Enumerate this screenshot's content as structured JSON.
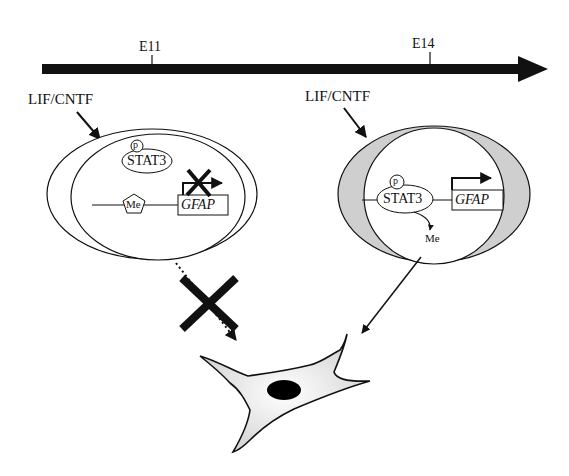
{
  "timeline": {
    "markers": [
      {
        "label": "E11",
        "x": 152
      },
      {
        "label": "E14",
        "x": 430
      }
    ]
  },
  "stimulus_label": "LIF/CNTF",
  "left_cell": {
    "stimulus": "LIF/CNTF",
    "phospho": "p",
    "factor": "STAT3",
    "methyl": "Me",
    "gene": "GFAP",
    "transcription": "blocked"
  },
  "right_cell": {
    "stimulus": "LIF/CNTF",
    "phospho": "p",
    "factor": "STAT3",
    "methyl": "Me",
    "gene": "GFAP",
    "transcription": "active"
  },
  "outcome": {
    "left_path": "blocked",
    "right_path": "astrocyte"
  },
  "colors": {
    "ink": "#111111",
    "shade": "#c8c8c8",
    "nucleus": "#000000"
  }
}
